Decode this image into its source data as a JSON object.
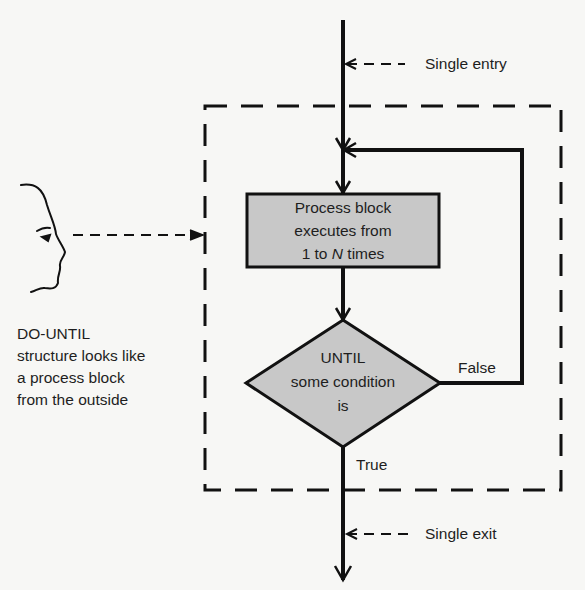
{
  "diagram": {
    "type": "flowchart",
    "structure": "DO-UNTIL",
    "labels": {
      "single_entry": "Single entry",
      "single_exit": "Single exit",
      "false_label": "False",
      "true_label": "True"
    },
    "process_block": {
      "lines": [
        "Process block",
        "executes from",
        "1 to "
      ],
      "italic_var": "N",
      "suffix": " times"
    },
    "decision": {
      "lines": [
        "UNTIL",
        "some condition",
        "is"
      ]
    },
    "observer_note": {
      "lines": [
        "DO-UNTIL",
        "structure looks like",
        "a process block",
        "from the outside"
      ]
    },
    "icons": {
      "observer": "face-profile-icon"
    },
    "colors": {
      "line": "#111111",
      "fill": "#c8c8c8",
      "background": "#f7f7f5"
    }
  }
}
